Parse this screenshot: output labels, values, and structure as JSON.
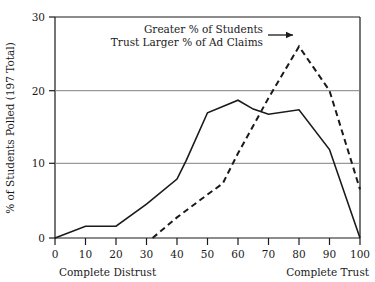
{
  "chart_data": {
    "type": "line",
    "title": "",
    "xlabel": "",
    "ylabel": "% of Students Polled (197 Total)",
    "xlim": [
      0,
      100
    ],
    "ylim": [
      0,
      30
    ],
    "grid": true,
    "gridlines_y": [
      10,
      20
    ],
    "legend_position": "none",
    "x_tick_labels": [
      "0",
      "10",
      "20",
      "30",
      "40",
      "50",
      "60",
      "70",
      "80",
      "90",
      "100"
    ],
    "x_ticks": [
      0,
      10,
      20,
      30,
      40,
      50,
      60,
      70,
      80,
      90,
      100
    ],
    "y_tick_labels": [
      "0",
      "10",
      "20",
      "30"
    ],
    "y_ticks": [
      0,
      10,
      20,
      30
    ],
    "axis_end_captions": {
      "left": "Complete Distrust",
      "right": "Complete Trust"
    },
    "annotations": [
      {
        "name": "trust-annotation",
        "line1": "Greater % of Students",
        "line2": "Trust Larger % of Ad Claims",
        "arrow": "right-arrow",
        "points_to": {
          "x": 80,
          "y": 26
        }
      }
    ],
    "series": [
      {
        "name": "solid-series",
        "style": "solid",
        "color": "#1a1a1a",
        "x": [
          0,
          10,
          20,
          30,
          40,
          43,
          50,
          60,
          65,
          70,
          80,
          90,
          100
        ],
        "values": [
          0,
          1.6,
          1.6,
          4.6,
          8.0,
          10.5,
          17.0,
          18.7,
          17.5,
          16.8,
          17.4,
          12.0,
          0
        ]
      },
      {
        "name": "dashed-series",
        "style": "dashed",
        "color": "#1a1a1a",
        "x": [
          32,
          40,
          50,
          55,
          60,
          70,
          80,
          90,
          100
        ],
        "values": [
          0,
          2.8,
          5.9,
          7.4,
          11.5,
          19.0,
          26.0,
          20.0,
          6.6
        ]
      }
    ]
  }
}
